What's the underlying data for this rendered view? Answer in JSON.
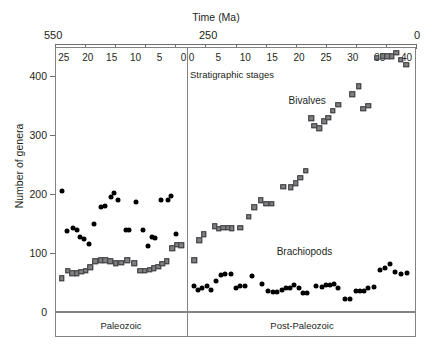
{
  "chart_data": {
    "type": "scatter",
    "title": "",
    "top_axis_label": "Time (Ma)",
    "ylabel": "Number of genera",
    "xlabel": "Stratigraphic stages",
    "ylim": [
      0,
      450
    ],
    "yticks": [
      0,
      100,
      200,
      300,
      400
    ],
    "grid": false,
    "legend_position": "inline-annotation",
    "time_axis_labels": [
      "550",
      "250",
      "0"
    ],
    "panels": [
      {
        "name": "Paleozoic",
        "x_ticks": [
          25,
          20,
          15,
          10,
          5,
          0
        ],
        "x_direction": "reversed",
        "x_range": [
          26,
          0
        ]
      },
      {
        "name": "Post-Paleozoic",
        "x_ticks": [
          0,
          5,
          10,
          15,
          20,
          25,
          30,
          35,
          40
        ],
        "x_direction": "normal",
        "x_range": [
          0,
          41
        ]
      }
    ],
    "series": [
      {
        "name": "Brachiopods",
        "marker": "filled-circle",
        "color": "#000000",
        "points_paleozoic": [
          {
            "x": 25.4,
            "y": 205
          },
          {
            "x": 24.3,
            "y": 138
          },
          {
            "x": 23.1,
            "y": 143
          },
          {
            "x": 22.3,
            "y": 140
          },
          {
            "x": 21.6,
            "y": 128
          },
          {
            "x": 20.7,
            "y": 124
          },
          {
            "x": 19.8,
            "y": 116
          },
          {
            "x": 18.7,
            "y": 150
          },
          {
            "x": 17.2,
            "y": 178
          },
          {
            "x": 16.4,
            "y": 180
          },
          {
            "x": 15.2,
            "y": 196
          },
          {
            "x": 14.6,
            "y": 202
          },
          {
            "x": 13.7,
            "y": 190
          },
          {
            "x": 12.1,
            "y": 140
          },
          {
            "x": 11.4,
            "y": 140
          },
          {
            "x": 10.0,
            "y": 186
          },
          {
            "x": 8.5,
            "y": 140
          },
          {
            "x": 7.4,
            "y": 112
          },
          {
            "x": 6.6,
            "y": 128
          },
          {
            "x": 5.9,
            "y": 126
          },
          {
            "x": 4.6,
            "y": 190
          },
          {
            "x": 3.3,
            "y": 190
          },
          {
            "x": 2.7,
            "y": 197
          },
          {
            "x": 1.6,
            "y": 133
          }
        ],
        "points_post_paleozoic": [
          {
            "x": 0.4,
            "y": 44
          },
          {
            "x": 1.2,
            "y": 38
          },
          {
            "x": 2.0,
            "y": 40
          },
          {
            "x": 2.9,
            "y": 44
          },
          {
            "x": 3.7,
            "y": 38
          },
          {
            "x": 4.6,
            "y": 52
          },
          {
            "x": 5.4,
            "y": 62
          },
          {
            "x": 6.3,
            "y": 64
          },
          {
            "x": 7.3,
            "y": 64
          },
          {
            "x": 8.2,
            "y": 40
          },
          {
            "x": 9.0,
            "y": 44
          },
          {
            "x": 9.9,
            "y": 44
          },
          {
            "x": 11.3,
            "y": 61
          },
          {
            "x": 13.1,
            "y": 47
          },
          {
            "x": 14.2,
            "y": 36
          },
          {
            "x": 15.1,
            "y": 34
          },
          {
            "x": 15.9,
            "y": 34
          },
          {
            "x": 16.8,
            "y": 38
          },
          {
            "x": 17.5,
            "y": 40
          },
          {
            "x": 18.3,
            "y": 40
          },
          {
            "x": 19.1,
            "y": 46
          },
          {
            "x": 20.0,
            "y": 40
          },
          {
            "x": 20.8,
            "y": 33
          },
          {
            "x": 21.5,
            "y": 32
          },
          {
            "x": 23.1,
            "y": 44
          },
          {
            "x": 24.3,
            "y": 42
          },
          {
            "x": 25.0,
            "y": 46
          },
          {
            "x": 25.7,
            "y": 46
          },
          {
            "x": 26.5,
            "y": 48
          },
          {
            "x": 27.3,
            "y": 40
          },
          {
            "x": 28.6,
            "y": 22
          },
          {
            "x": 29.4,
            "y": 22
          },
          {
            "x": 30.6,
            "y": 36
          },
          {
            "x": 31.4,
            "y": 36
          },
          {
            "x": 32.1,
            "y": 36
          },
          {
            "x": 32.9,
            "y": 40
          },
          {
            "x": 33.9,
            "y": 42
          },
          {
            "x": 35.1,
            "y": 72
          },
          {
            "x": 35.9,
            "y": 74
          },
          {
            "x": 36.9,
            "y": 82
          },
          {
            "x": 37.9,
            "y": 68
          },
          {
            "x": 38.9,
            "y": 64
          },
          {
            "x": 40.0,
            "y": 66
          }
        ]
      },
      {
        "name": "Bivalves",
        "marker": "filled-square",
        "color": "#808083",
        "points_paleozoic": [
          {
            "x": 25.4,
            "y": 57
          },
          {
            "x": 24.2,
            "y": 70
          },
          {
            "x": 23.2,
            "y": 66
          },
          {
            "x": 22.3,
            "y": 66
          },
          {
            "x": 21.4,
            "y": 68
          },
          {
            "x": 20.4,
            "y": 70
          },
          {
            "x": 19.5,
            "y": 76
          },
          {
            "x": 18.4,
            "y": 86
          },
          {
            "x": 17.3,
            "y": 88
          },
          {
            "x": 16.3,
            "y": 88
          },
          {
            "x": 15.3,
            "y": 86
          },
          {
            "x": 14.2,
            "y": 83
          },
          {
            "x": 13.0,
            "y": 84
          },
          {
            "x": 11.7,
            "y": 88
          },
          {
            "x": 10.3,
            "y": 83
          },
          {
            "x": 9.0,
            "y": 70
          },
          {
            "x": 8.1,
            "y": 70
          },
          {
            "x": 7.1,
            "y": 72
          },
          {
            "x": 6.2,
            "y": 74
          },
          {
            "x": 5.3,
            "y": 77
          },
          {
            "x": 4.4,
            "y": 82
          },
          {
            "x": 3.5,
            "y": 86
          },
          {
            "x": 2.4,
            "y": 108
          },
          {
            "x": 1.3,
            "y": 114
          },
          {
            "x": 0.5,
            "y": 113
          }
        ],
        "points_post_paleozoic": [
          {
            "x": 0.5,
            "y": 88
          },
          {
            "x": 1.4,
            "y": 122
          },
          {
            "x": 2.3,
            "y": 132
          },
          {
            "x": 4.3,
            "y": 146
          },
          {
            "x": 5.1,
            "y": 141
          },
          {
            "x": 5.9,
            "y": 143
          },
          {
            "x": 6.7,
            "y": 143
          },
          {
            "x": 7.5,
            "y": 142
          },
          {
            "x": 9.1,
            "y": 143
          },
          {
            "x": 10.6,
            "y": 162
          },
          {
            "x": 11.7,
            "y": 178
          },
          {
            "x": 12.9,
            "y": 190
          },
          {
            "x": 13.9,
            "y": 184
          },
          {
            "x": 14.9,
            "y": 184
          },
          {
            "x": 17.1,
            "y": 213
          },
          {
            "x": 18.5,
            "y": 212
          },
          {
            "x": 19.4,
            "y": 219
          },
          {
            "x": 20.2,
            "y": 228
          },
          {
            "x": 21.2,
            "y": 240
          },
          {
            "x": 22.3,
            "y": 329
          },
          {
            "x": 22.8,
            "y": 316
          },
          {
            "x": 23.8,
            "y": 312
          },
          {
            "x": 24.7,
            "y": 324
          },
          {
            "x": 25.4,
            "y": 330
          },
          {
            "x": 26.3,
            "y": 342
          },
          {
            "x": 27.3,
            "y": 352
          },
          {
            "x": 29.9,
            "y": 370
          },
          {
            "x": 31.1,
            "y": 383
          },
          {
            "x": 31.9,
            "y": 345
          },
          {
            "x": 32.9,
            "y": 350
          },
          {
            "x": 34.4,
            "y": 432
          },
          {
            "x": 35.6,
            "y": 434
          },
          {
            "x": 36.4,
            "y": 434
          },
          {
            "x": 37.2,
            "y": 434
          },
          {
            "x": 38.1,
            "y": 440
          },
          {
            "x": 38.9,
            "y": 428
          },
          {
            "x": 39.9,
            "y": 420
          }
        ]
      }
    ],
    "annotations": [
      {
        "text": "Bivalves",
        "panel": "Post-Paleozoic",
        "x": 21.5,
        "y": 360
      },
      {
        "text": "Brachiopods",
        "panel": "Post-Paleozoic",
        "x": 21.0,
        "y": 103
      }
    ]
  }
}
